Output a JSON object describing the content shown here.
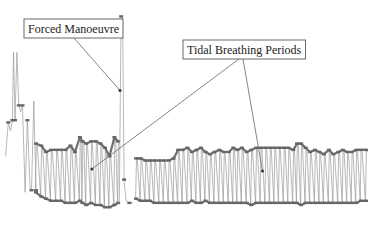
{
  "chart_data": {
    "type": "line",
    "title": "",
    "xlabel": "",
    "ylabel": "",
    "grid": false,
    "axes_visible": false,
    "y_range": [
      0,
      100
    ],
    "x_range": [
      0,
      100
    ],
    "annotations": [
      {
        "id": "forced",
        "text": "Forced Manoeuvre",
        "targets": [
          [
            32.0,
            62
          ]
        ]
      },
      {
        "id": "tidal",
        "text": "Tidal Breathing Periods",
        "targets": [
          [
            24.5,
            25
          ],
          [
            70.0,
            24
          ]
        ]
      }
    ],
    "segments": [
      {
        "name": "initial irregular breaths",
        "points": [
          [
            1.5,
            31
          ],
          [
            2.2,
            47
          ],
          [
            2.8,
            43
          ],
          [
            3.3,
            48
          ],
          [
            3.6,
            80
          ],
          [
            4.0,
            48
          ],
          [
            4.5,
            80
          ],
          [
            5.0,
            55
          ],
          [
            5.5,
            52
          ],
          [
            6.0,
            55
          ],
          [
            6.7,
            14
          ],
          [
            7.3,
            48
          ],
          [
            8.0,
            16
          ],
          [
            8.4,
            15
          ],
          [
            9.0,
            57
          ],
          [
            9.6,
            15
          ]
        ]
      },
      {
        "name": "tidal breathing period 1",
        "peaks": [
          [
            9.6,
            37
          ],
          [
            11,
            36
          ],
          [
            12.3,
            33
          ],
          [
            13.6,
            34
          ],
          [
            15.0,
            34
          ],
          [
            16.3,
            34
          ],
          [
            17.5,
            34
          ],
          [
            18.8,
            36
          ],
          [
            20.0,
            33
          ],
          [
            21.3,
            40
          ],
          [
            22.0,
            38
          ],
          [
            23,
            37
          ],
          [
            24.3,
            38
          ],
          [
            25.6,
            38
          ],
          [
            26.8,
            37
          ],
          [
            28.0,
            35
          ],
          [
            29.2,
            31
          ],
          [
            30.5,
            40
          ],
          [
            31.5,
            38
          ]
        ],
        "troughs": [
          [
            9.6,
            14
          ],
          [
            11,
            12
          ],
          [
            12.3,
            11
          ],
          [
            13.6,
            10
          ],
          [
            15.0,
            10
          ],
          [
            16.3,
            10
          ],
          [
            17.5,
            9
          ],
          [
            18.8,
            9
          ],
          [
            20.0,
            9
          ],
          [
            21.3,
            10
          ],
          [
            22.0,
            9
          ],
          [
            23,
            8
          ],
          [
            24.3,
            9
          ],
          [
            25.6,
            8
          ],
          [
            26.8,
            8
          ],
          [
            28.0,
            7
          ],
          [
            29.2,
            7
          ],
          [
            30.5,
            8
          ],
          [
            31.5,
            9
          ]
        ]
      },
      {
        "name": "forced manoeuvre",
        "points": [
          [
            31.8,
            9
          ],
          [
            32.3,
            97
          ],
          [
            32.7,
            97
          ],
          [
            33.1,
            20
          ],
          [
            33.6,
            10
          ],
          [
            34.5,
            9
          ],
          [
            35.5,
            9
          ]
        ]
      },
      {
        "name": "tidal breathing period 2",
        "peaks": [
          [
            36.3,
            30
          ],
          [
            37.5,
            30
          ],
          [
            38.8,
            29
          ],
          [
            40.0,
            29
          ],
          [
            41.2,
            29
          ],
          [
            42.5,
            29
          ],
          [
            43.7,
            29
          ],
          [
            45,
            29
          ],
          [
            46.3,
            30
          ],
          [
            47.5,
            34
          ],
          [
            48.7,
            34
          ],
          [
            50,
            35
          ],
          [
            51.2,
            33
          ],
          [
            52.4,
            34
          ],
          [
            53.6,
            35
          ],
          [
            54.8,
            33
          ],
          [
            56,
            32
          ],
          [
            57.2,
            33
          ],
          [
            58.5,
            34
          ],
          [
            59.7,
            33
          ],
          [
            61,
            33
          ],
          [
            62.2,
            35
          ],
          [
            63.3,
            34
          ],
          [
            64.5,
            35
          ],
          [
            65.8,
            33
          ],
          [
            67,
            34
          ],
          [
            68.3,
            35
          ],
          [
            69.5,
            35
          ],
          [
            70.8,
            35
          ],
          [
            72,
            35
          ],
          [
            73.2,
            35
          ],
          [
            74.4,
            35
          ],
          [
            75.7,
            35
          ],
          [
            76.9,
            35
          ],
          [
            78.2,
            34
          ],
          [
            79.2,
            37
          ],
          [
            80.3,
            37
          ],
          [
            81.5,
            35
          ],
          [
            82.7,
            33
          ],
          [
            84,
            34
          ],
          [
            85.2,
            33
          ],
          [
            86.4,
            32
          ],
          [
            87.7,
            34
          ],
          [
            88.9,
            32
          ],
          [
            90.2,
            33
          ],
          [
            91.4,
            34
          ],
          [
            92.6,
            33
          ],
          [
            93.8,
            33
          ],
          [
            95,
            34
          ],
          [
            96.2,
            34
          ],
          [
            97.6,
            34
          ]
        ],
        "troughs": [
          [
            36.3,
            11
          ],
          [
            37.5,
            10
          ],
          [
            38.8,
            10
          ],
          [
            40,
            10
          ],
          [
            41.2,
            9
          ],
          [
            42.5,
            9
          ],
          [
            43.7,
            9
          ],
          [
            45,
            9
          ],
          [
            46.3,
            9
          ],
          [
            47.5,
            9
          ],
          [
            48.7,
            9
          ],
          [
            50,
            9
          ],
          [
            51.2,
            10
          ],
          [
            52.4,
            9
          ],
          [
            53.6,
            9
          ],
          [
            54.8,
            10
          ],
          [
            56,
            9
          ],
          [
            57.2,
            9
          ],
          [
            58.5,
            9
          ],
          [
            59.7,
            9
          ],
          [
            61,
            9
          ],
          [
            62.2,
            9
          ],
          [
            63.3,
            9
          ],
          [
            64.5,
            9
          ],
          [
            65.8,
            9
          ],
          [
            67,
            8
          ],
          [
            68.3,
            9
          ],
          [
            69.5,
            9
          ],
          [
            70.8,
            9
          ],
          [
            72,
            9
          ],
          [
            73.2,
            9
          ],
          [
            74.4,
            9
          ],
          [
            75.7,
            9
          ],
          [
            76.9,
            9
          ],
          [
            78.2,
            9
          ],
          [
            79.2,
            9
          ],
          [
            80.3,
            8
          ],
          [
            81.5,
            9
          ],
          [
            82.7,
            9
          ],
          [
            84,
            9
          ],
          [
            85.2,
            9
          ],
          [
            86.4,
            9
          ],
          [
            87.7,
            9
          ],
          [
            88.9,
            9
          ],
          [
            90.2,
            9
          ],
          [
            91.4,
            9
          ],
          [
            92.6,
            9
          ],
          [
            93.8,
            9
          ],
          [
            95,
            9
          ],
          [
            96.2,
            10
          ],
          [
            97.6,
            10
          ]
        ]
      }
    ]
  }
}
